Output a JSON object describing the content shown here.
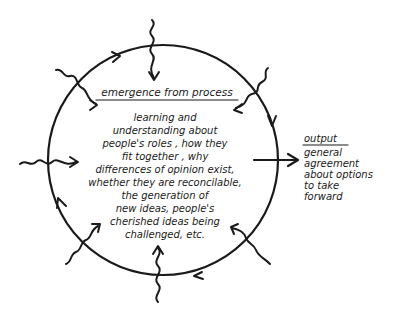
{
  "diagram": {
    "circle_heading": "emergence from process",
    "center_text_lines": [
      "learning and",
      "understanding about",
      "people's roles , how they",
      "fit together , why",
      "differences of opinion exist,",
      "whether they are reconcilable,",
      "the generation of",
      "new ideas, people's",
      "cherished ideas being",
      "challenged, etc."
    ],
    "output": {
      "heading": "output",
      "lines": [
        "general",
        "agreement",
        "about options",
        "to take",
        "forward"
      ]
    },
    "colors": {
      "ink": "#1a1a1a",
      "background": "#ffffff"
    },
    "inputs_count": 8
  }
}
